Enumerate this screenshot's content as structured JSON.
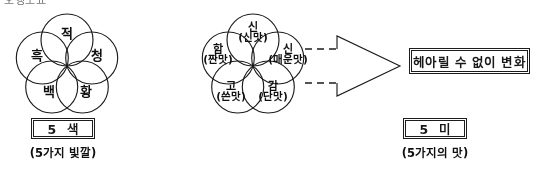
{
  "page": {
    "clipped_header_text": "오행도표",
    "background_color": "#ffffff",
    "ink_color": "#1e1e1e"
  },
  "five_colors": {
    "diagram_name": "five-colors-rosette",
    "petals": [
      {
        "position": "top",
        "label": "적"
      },
      {
        "position": "right",
        "label": "청"
      },
      {
        "position": "bottom-right",
        "label": "황"
      },
      {
        "position": "bottom-left",
        "label": "백"
      },
      {
        "position": "left",
        "label": "흑"
      }
    ],
    "box_label": "5 색",
    "caption": "(5가지 빛깔)"
  },
  "five_tastes": {
    "diagram_name": "five-tastes-rosette",
    "petals": [
      {
        "position": "top",
        "label": "신",
        "sub": "(신맛)"
      },
      {
        "position": "right",
        "label": "신",
        "sub": "(매운맛)"
      },
      {
        "position": "bottom-right",
        "label": "감",
        "sub": "(단맛)"
      },
      {
        "position": "bottom-left",
        "label": "고",
        "sub": "(쓴맛)"
      },
      {
        "position": "left",
        "label": "함",
        "sub": "(짠맛)"
      }
    ],
    "box_label": "5 미",
    "caption": "(5가지의 맛)"
  },
  "arrow": {
    "style": "hollow-outlined-right-arrow-with-dashed-tail",
    "direction": "right",
    "dash_line_count": 2
  },
  "result": {
    "box_label": "헤아릴 수 없이 변화"
  }
}
